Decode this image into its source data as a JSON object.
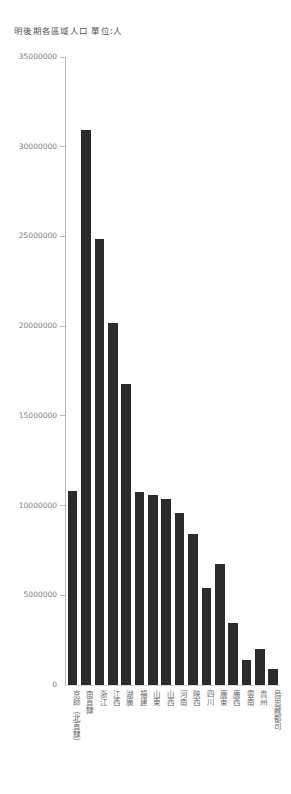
{
  "chart_data": {
    "type": "bar",
    "title": "明後期各區域人口 單位:人",
    "xlabel": "",
    "ylabel": "",
    "ylim": [
      0,
      35000000
    ],
    "grid": false,
    "legend": null,
    "y_ticks": [
      {
        "value": 35000000,
        "label": "35000000"
      },
      {
        "value": 30000000,
        "label": "30000000"
      },
      {
        "value": 25000000,
        "label": "25000000"
      },
      {
        "value": 20000000,
        "label": "20000000"
      },
      {
        "value": 15000000,
        "label": "15000000"
      },
      {
        "value": 10000000,
        "label": "10000000"
      },
      {
        "value": 5000000,
        "label": "5000000"
      },
      {
        "value": 0,
        "label": "0"
      }
    ],
    "categories": [
      "京師（北直隸）",
      "南直隸",
      "浙江",
      "江西",
      "湖廣",
      "福建",
      "山東",
      "山西",
      "河南",
      "陝西",
      "四川",
      "廣東",
      "廣西",
      "雲南",
      "貴州",
      "烏思藏都司"
    ],
    "values": [
      10800000,
      30950000,
      24850000,
      20200000,
      16800000,
      10750000,
      10600000,
      10350000,
      9600000,
      8400000,
      5400000,
      6750000,
      3450000,
      1400000,
      2000000,
      900000
    ],
    "bar_color": "#2b2b2b"
  }
}
